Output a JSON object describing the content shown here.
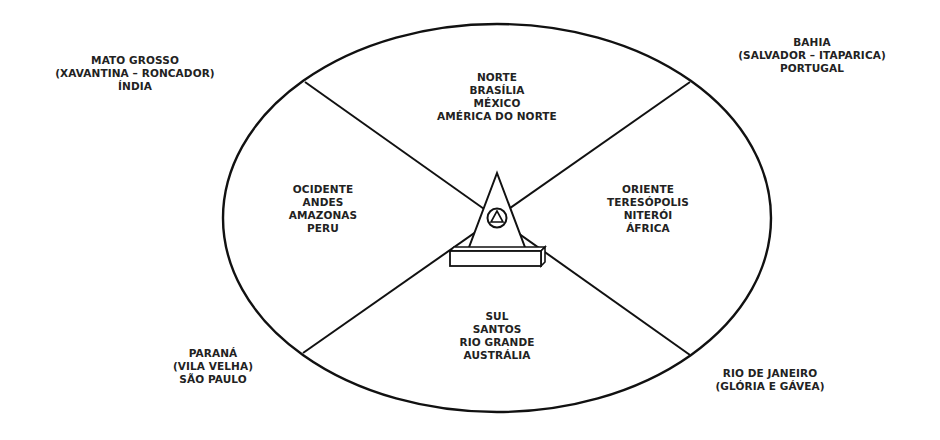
{
  "diagram": {
    "type": "directional-ellipse-map",
    "center_symbol": "pyramid-with-circled-triangle-on-plinth",
    "colors": {
      "stroke": "#111111",
      "text": "#222222",
      "background": "#ffffff"
    },
    "inner_regions": {
      "north": {
        "lines": [
          "NORTE",
          "BRASÍLIA",
          "MÉXICO",
          "AMÉRICA DO NORTE"
        ]
      },
      "west": {
        "lines": [
          "OCIDENTE",
          "ANDES",
          "AMAZONAS",
          "PERU"
        ]
      },
      "east": {
        "lines": [
          "ORIENTE",
          "TERESÓPOLIS",
          "NITERÓI",
          "ÁFRICA"
        ]
      },
      "south": {
        "lines": [
          "SUL",
          "SANTOS",
          "RIO GRANDE",
          "AUSTRÁLIA"
        ]
      }
    },
    "outer_labels": {
      "top_left": {
        "lines": [
          "MATO GROSSO",
          "(XAVANTINA – RONCADOR)",
          "ÍNDIA"
        ]
      },
      "top_right": {
        "lines": [
          "BAHIA",
          "(SALVADOR – ITAPARICA)",
          "PORTUGAL"
        ]
      },
      "bottom_left": {
        "lines": [
          "PARANÁ",
          "(VILA VELHA)",
          "SÃO PAULO"
        ]
      },
      "bottom_right": {
        "lines": [
          "RIO DE JANEIRO",
          "(GLÓRIA E GÁVEA)"
        ]
      }
    }
  }
}
